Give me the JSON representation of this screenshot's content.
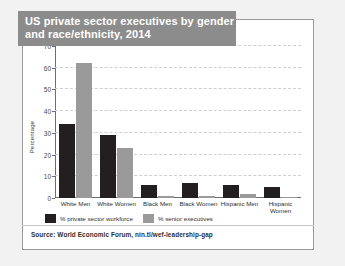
{
  "title": {
    "line1": "US private sector executives by gender",
    "line2": "and race/ethnicity, 2014"
  },
  "source": {
    "label": "Source: World Economic Forum, nin.tl/wef-leadership-gap"
  },
  "colors": {
    "series_workforce": "#231f20",
    "series_executives": "#9a9a9a",
    "title_banner": "#8c8c8c",
    "card_background": "#ffffff",
    "page_background": "#f2f2f2",
    "gridline": "#cfcfcf",
    "axis": "#6e6e6e"
  },
  "chart_data": {
    "type": "bar",
    "title": "US private sector executives by gender and race/ethnicity, 2014",
    "subtitle": "",
    "xlabel": "",
    "ylabel": "Percentage",
    "ylim": [
      0,
      70
    ],
    "yticks": [
      0,
      10,
      20,
      30,
      40,
      50,
      60,
      70
    ],
    "ytick_labels": [
      "0",
      "10",
      "20",
      "30",
      "40",
      "50",
      "60",
      "70"
    ],
    "grid": true,
    "legend_position": "bottom-left",
    "categories": [
      "White Men",
      "White Women",
      "Black Men",
      "Black Women",
      "Hispanic Men",
      "Hispanic Women"
    ],
    "series": [
      {
        "name": "% private sector workforce",
        "color": "#231f20",
        "values": [
          34,
          29,
          6,
          7,
          6,
          5
        ]
      },
      {
        "name": "% senior executives",
        "color": "#9a9a9a",
        "values": [
          62,
          23,
          1,
          1,
          2,
          0.5
        ]
      }
    ]
  }
}
